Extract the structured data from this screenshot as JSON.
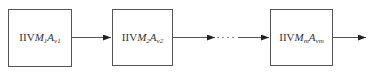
{
  "diagram": {
    "type": "sequential-block-chain",
    "blocks": [
      {
        "prefix": "IIV",
        "m_var": "M",
        "m_sub": "1",
        "a_var": "A",
        "a_sub": "v1"
      },
      {
        "prefix": "IIV",
        "m_var": "M",
        "m_sub": "2",
        "a_var": "A",
        "a_sub": "v2"
      },
      {
        "prefix": "IIV",
        "m_var": "M",
        "m_sub": "m",
        "a_var": "A",
        "a_sub": "vm"
      }
    ],
    "connectors": [
      {
        "from": 0,
        "to": 1,
        "style": "solid"
      },
      {
        "from": 1,
        "to": 2,
        "style": "solid-dashed-solid"
      },
      {
        "from": 2,
        "to": "out",
        "style": "solid"
      }
    ],
    "colors": {
      "stroke": "#555555",
      "text": "#333333",
      "background": "#ffffff"
    }
  }
}
